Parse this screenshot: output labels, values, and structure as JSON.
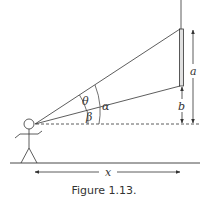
{
  "figure": {
    "caption": "Figure 1.13.",
    "labels": {
      "theta": "θ",
      "alpha": "α",
      "beta": "β",
      "a": "a",
      "b": "b",
      "x": "x"
    },
    "colors": {
      "line": "#333333",
      "picture_fill": "#e0e0e0",
      "background": "#ffffff"
    }
  }
}
